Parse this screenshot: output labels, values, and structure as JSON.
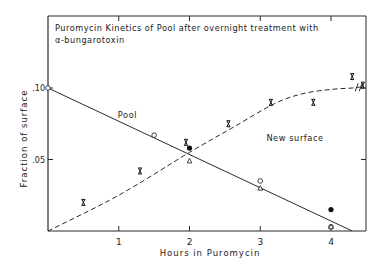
{
  "chart_data": {
    "type": "line",
    "title_lines": [
      "Puromycin Kinetics of Pool after overnight treatment with",
      "α-bungarotoxin"
    ],
    "xlabel": "Hours in Puromycin",
    "ylabel": "Fraction of surface",
    "xlim": [
      0,
      4.45
    ],
    "ylim": [
      0,
      0.15
    ],
    "x_ticks": [
      1,
      2,
      3,
      4
    ],
    "x_tick_labels": [
      "1",
      "2",
      "3",
      "4"
    ],
    "y_ticks": [
      0.05,
      0.1
    ],
    "y_tick_labels": [
      ".05",
      ".10"
    ],
    "grid": false,
    "annotations": [
      {
        "text": "Pool",
        "x": 1.1,
        "y": 0.081
      },
      {
        "text": "New surface",
        "x": 3.2,
        "y": 0.065
      }
    ],
    "series": [
      {
        "name": "Pool (fit line)",
        "style": "solid",
        "points": [
          [
            0,
            0.1
          ],
          [
            4.3,
            0.0
          ]
        ]
      },
      {
        "name": "New surface (fit curve)",
        "style": "dashed",
        "points": [
          [
            0,
            0.0
          ],
          [
            1,
            0.025
          ],
          [
            2,
            0.055
          ],
          [
            2.6,
            0.072
          ],
          [
            3.2,
            0.089
          ],
          [
            3.6,
            0.096
          ],
          [
            4.0,
            0.099
          ],
          [
            4.3,
            0.1
          ],
          [
            4.45,
            0.101
          ]
        ]
      },
      {
        "name": "Pool open circles",
        "marker": "circle-open",
        "points": [
          [
            0,
            0.1
          ],
          [
            1.5,
            0.067
          ],
          [
            3,
            0.035
          ],
          [
            4,
            0.003
          ]
        ]
      },
      {
        "name": "Pool filled circles",
        "marker": "circle-filled",
        "points": [
          [
            2,
            0.058
          ],
          [
            4,
            0.015
          ]
        ]
      },
      {
        "name": "Pool triangles",
        "marker": "triangle-open",
        "points": [
          [
            2,
            0.049
          ],
          [
            3,
            0.03
          ],
          [
            4,
            0.003
          ]
        ]
      },
      {
        "name": "New surface X markers",
        "marker": "x",
        "points": [
          [
            0.5,
            0.02
          ],
          [
            1.3,
            0.042
          ],
          [
            1.95,
            0.062
          ],
          [
            2.55,
            0.075
          ],
          [
            3.15,
            0.09
          ],
          [
            3.75,
            0.09
          ],
          [
            4.3,
            0.108
          ],
          [
            4.45,
            0.102
          ]
        ]
      }
    ]
  }
}
